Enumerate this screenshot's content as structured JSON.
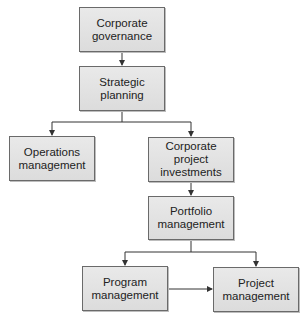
{
  "diagram": {
    "type": "hierarchy-flowchart",
    "nodes": [
      {
        "id": "corporate-governance",
        "label": "Corporate\ngovernance"
      },
      {
        "id": "strategic-planning",
        "label": "Strategic\nplanning"
      },
      {
        "id": "operations-management",
        "label": "Operations\nmanagement"
      },
      {
        "id": "corporate-project-investments",
        "label": "Corporate project\ninvestments"
      },
      {
        "id": "portfolio-management",
        "label": "Portfolio\nmanagement"
      },
      {
        "id": "program-management",
        "label": "Program\nmanagement"
      },
      {
        "id": "project-management",
        "label": "Project\nmanagement"
      }
    ],
    "edges": [
      {
        "from": "corporate-governance",
        "to": "strategic-planning"
      },
      {
        "from": "strategic-planning",
        "to": "operations-management"
      },
      {
        "from": "strategic-planning",
        "to": "corporate-project-investments"
      },
      {
        "from": "corporate-project-investments",
        "to": "portfolio-management"
      },
      {
        "from": "portfolio-management",
        "to": "program-management"
      },
      {
        "from": "portfolio-management",
        "to": "project-management"
      },
      {
        "from": "program-management",
        "to": "project-management"
      }
    ],
    "colors": {
      "box_fill": "#e0e0e0",
      "box_border": "#6a6a6a",
      "line": "#333333",
      "text": "#222222"
    }
  }
}
